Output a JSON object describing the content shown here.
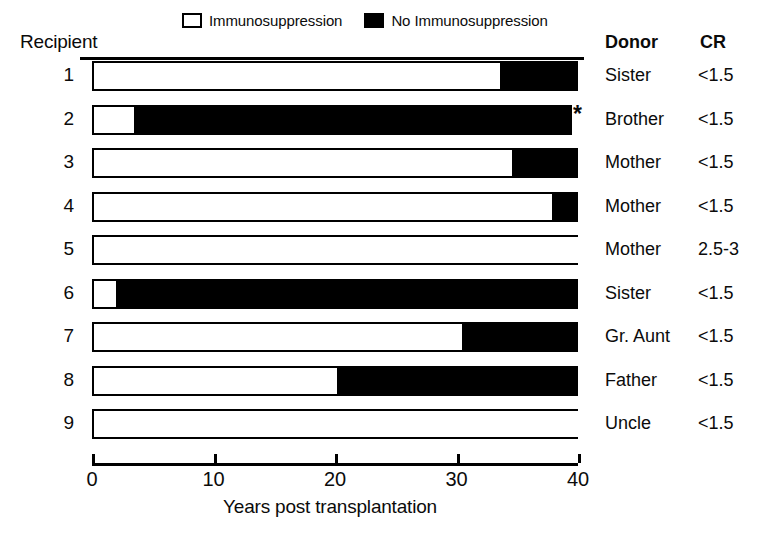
{
  "chart_data": {
    "type": "bar",
    "orientation": "horizontal",
    "stacked": true,
    "title": "",
    "xlabel": "Years post transplantation",
    "ylabel": "Recipient",
    "xlim": [
      0,
      40
    ],
    "xticks": [
      0,
      10,
      20,
      30,
      40
    ],
    "xtick_labels": [
      "0",
      "10",
      "20",
      "30",
      "40"
    ],
    "grid": false,
    "legend_position": "top",
    "legend": [
      {
        "label": "Immunosuppression",
        "fill": "#ffffff",
        "stroke": "#000000"
      },
      {
        "label": "No Immunosuppression",
        "fill": "#000000",
        "stroke": "#000000"
      }
    ],
    "categories": [
      "1",
      "2",
      "3",
      "4",
      "5",
      "6",
      "7",
      "8",
      "9"
    ],
    "series": [
      {
        "name": "Immunosuppression",
        "values": [
          33.6,
          3.5,
          34.6,
          37.9,
          40.0,
          2.0,
          30.5,
          20.2,
          40.0
        ]
      },
      {
        "name": "No Immunosuppression",
        "values": [
          6.4,
          36.0,
          5.4,
          2.1,
          0.0,
          38.0,
          9.5,
          19.8,
          0.0
        ]
      }
    ],
    "annotations": [
      {
        "row": "2",
        "marker": "*",
        "x": 39.5
      }
    ],
    "rows": [
      {
        "recipient": "1",
        "immuno_end": 33.6,
        "total": 40.0,
        "donor": "Sister",
        "cr": "<1.5",
        "marker": ""
      },
      {
        "recipient": "2",
        "immuno_end": 3.5,
        "total": 39.5,
        "donor": "Brother",
        "cr": "<1.5",
        "marker": "*"
      },
      {
        "recipient": "3",
        "immuno_end": 34.6,
        "total": 40.0,
        "donor": "Mother",
        "cr": "<1.5",
        "marker": ""
      },
      {
        "recipient": "4",
        "immuno_end": 37.9,
        "total": 40.0,
        "donor": "Mother",
        "cr": "<1.5",
        "marker": ""
      },
      {
        "recipient": "5",
        "immuno_end": 40.0,
        "total": 40.0,
        "donor": "Mother",
        "cr": "2.5-3",
        "marker": ""
      },
      {
        "recipient": "6",
        "immuno_end": 2.0,
        "total": 40.0,
        "donor": "Sister",
        "cr": "<1.5",
        "marker": ""
      },
      {
        "recipient": "7",
        "immuno_end": 30.5,
        "total": 40.0,
        "donor": "Gr. Aunt",
        "cr": "<1.5",
        "marker": ""
      },
      {
        "recipient": "8",
        "immuno_end": 20.2,
        "total": 40.0,
        "donor": "Father",
        "cr": "<1.5",
        "marker": ""
      },
      {
        "recipient": "9",
        "immuno_end": 40.0,
        "total": 40.0,
        "donor": "Uncle",
        "cr": "<1.5",
        "marker": ""
      }
    ]
  },
  "headers": {
    "recipient": "Recipient",
    "donor": "Donor",
    "cr": "CR"
  },
  "colors": {
    "ink": "#000000",
    "paper": "#ffffff"
  }
}
